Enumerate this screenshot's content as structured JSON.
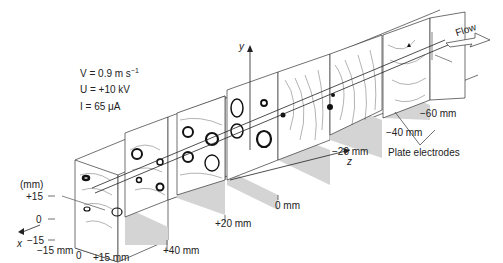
{
  "parameters": {
    "velocity": "V = 0.9 m s",
    "velocity_exp": "−1",
    "voltage": "U = +10 kV",
    "current": "I = 65 μA"
  },
  "axes": {
    "x_label": "x",
    "y_label": "y",
    "z_label": "z",
    "y_unit": "(mm)",
    "y_ticks": [
      "+15",
      "0",
      "−15"
    ],
    "x_ticks": [
      "−15 mm",
      "0",
      "+15 mm"
    ]
  },
  "z_positions": [
    "+40 mm",
    "+20 mm",
    "0 mm",
    "−20 mm",
    "−40 mm",
    "−60 mm"
  ],
  "annotations": {
    "flow": "Flow",
    "electrodes": "Plate electrodes"
  },
  "colors": {
    "line": "#333333",
    "shade": "#d4d4d4",
    "vortex": "#111111"
  }
}
